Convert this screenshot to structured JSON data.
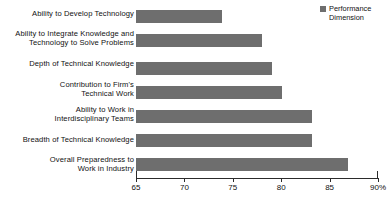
{
  "chart_data": {
    "type": "bar",
    "orientation": "horizontal",
    "title": "",
    "xlabel": "",
    "ylabel": "",
    "xlim": [
      65,
      90
    ],
    "xticks": [
      "65",
      "70",
      "75",
      "80",
      "85",
      "90%"
    ],
    "xtick_values": [
      65,
      70,
      75,
      80,
      85,
      90
    ],
    "grid": false,
    "legend_position": "top-right",
    "categories": [
      "Ability to Develop Technology",
      "Ability to Integrate Knowledge and\nTechnology to Solve Problems",
      "Depth of Technical Knowledge",
      "Contribution to Firm's\nTechnical Work",
      "Ability to Work in\nInterdisciplinary Teams",
      "Breadth of Technical Knowledge",
      "Overall Preparedness to\nWork in Industry"
    ],
    "values": [
      73.9,
      78.0,
      79.0,
      80.1,
      83.2,
      83.2,
      86.9
    ],
    "series": [
      {
        "name": "Performance Dimension",
        "values": [
          73.9,
          78.0,
          79.0,
          80.1,
          83.2,
          83.2,
          86.9
        ]
      }
    ],
    "bar_color": "#6e6e6e",
    "axis_color": "#2b2b2b"
  },
  "legend": {
    "label": "Performance\nDimension"
  }
}
